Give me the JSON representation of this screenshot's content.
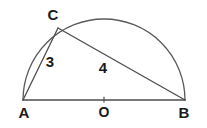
{
  "figure": {
    "type": "geometry-diagram",
    "background_color": "#ffffff",
    "stroke_color": "#4d4d4d",
    "label_color": "#1a1a1a",
    "points": {
      "A": {
        "label": "A",
        "x": 23,
        "y": 100,
        "label_x": 24,
        "label_y": 118
      },
      "B": {
        "label": "B",
        "x": 185,
        "y": 100,
        "label_x": 184,
        "label_y": 118
      },
      "C": {
        "label": "C",
        "x": 58,
        "y": 28,
        "label_x": 53,
        "label_y": 20
      },
      "O": {
        "label": "O",
        "x": 104,
        "y": 100,
        "label_x": 104,
        "label_y": 117
      }
    },
    "segments": [
      {
        "name": "diameter-AB",
        "from": "A",
        "to": "B",
        "length_label": ""
      },
      {
        "name": "side-AC",
        "from": "A",
        "to": "C",
        "length_label": "3"
      },
      {
        "name": "side-CB",
        "from": "C",
        "to": "B",
        "length_label": "4"
      }
    ],
    "length_labels": {
      "AC": {
        "text": "3",
        "x": 50,
        "y": 67
      },
      "CB": {
        "text": "4",
        "x": 103,
        "y": 73
      }
    },
    "arc": {
      "name": "semicircle-arc",
      "center_x": 104,
      "center_y": 100,
      "radius": 81,
      "start_angle_deg": 180,
      "end_angle_deg": 0
    }
  }
}
